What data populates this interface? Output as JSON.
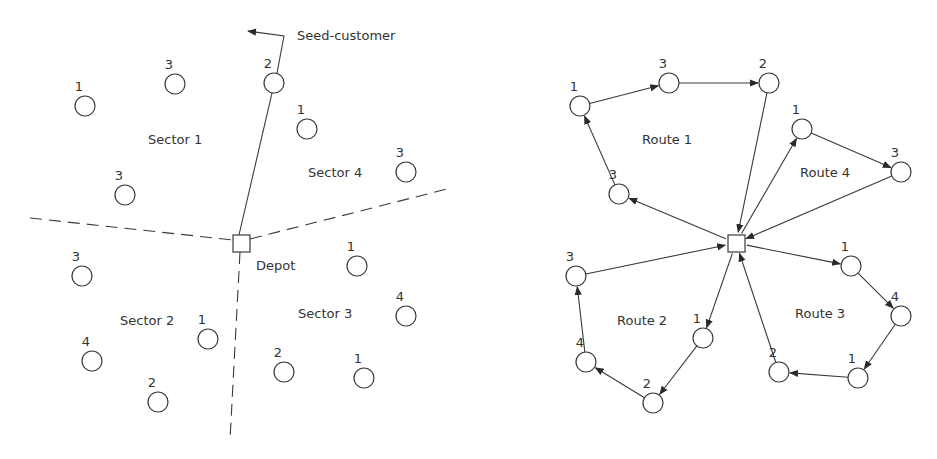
{
  "left_diagram": {
    "depot": {
      "label": "Depot",
      "x": 241,
      "y": 243
    },
    "seed_customer_label": "Seed-customer",
    "sectors": [
      {
        "label": "Sector 1",
        "x": 148,
        "y": 144
      },
      {
        "label": "Sector 2",
        "x": 120,
        "y": 325
      },
      {
        "label": "Sector 3",
        "x": 298,
        "y": 318
      },
      {
        "label": "Sector 4",
        "x": 308,
        "y": 177
      }
    ],
    "customers": [
      {
        "demand": "1",
        "x": 85,
        "y": 106,
        "sector": 1
      },
      {
        "demand": "3",
        "x": 175,
        "y": 84,
        "sector": 1
      },
      {
        "demand": "3",
        "x": 125,
        "y": 195,
        "sector": 1
      },
      {
        "demand": "2",
        "x": 274,
        "y": 83,
        "sector": 1,
        "seed": true
      },
      {
        "demand": "1",
        "x": 307,
        "y": 129,
        "sector": 4
      },
      {
        "demand": "3",
        "x": 406,
        "y": 172,
        "sector": 4
      },
      {
        "demand": "3",
        "x": 82,
        "y": 276,
        "sector": 2
      },
      {
        "demand": "4",
        "x": 92,
        "y": 361,
        "sector": 2
      },
      {
        "demand": "2",
        "x": 158,
        "y": 402,
        "sector": 2
      },
      {
        "demand": "1",
        "x": 208,
        "y": 339,
        "sector": 2
      },
      {
        "demand": "1",
        "x": 357,
        "y": 266,
        "sector": 3
      },
      {
        "demand": "4",
        "x": 406,
        "y": 316,
        "sector": 3
      },
      {
        "demand": "2",
        "x": 284,
        "y": 372,
        "sector": 3
      },
      {
        "demand": "1",
        "x": 364,
        "y": 378,
        "sector": 3
      }
    ]
  },
  "right_diagram": {
    "depot": {
      "x": 736,
      "y": 243
    },
    "routes": [
      {
        "label": "Route 1",
        "lx": 642,
        "ly": 144,
        "stops": [
          {
            "demand": "3",
            "x": 619,
            "y": 194
          },
          {
            "demand": "1",
            "x": 580,
            "y": 106
          },
          {
            "demand": "3",
            "x": 669,
            "y": 83
          },
          {
            "demand": "2",
            "x": 769,
            "y": 83
          }
        ]
      },
      {
        "label": "Route 2",
        "lx": 617,
        "ly": 325,
        "stops": [
          {
            "demand": "1",
            "x": 703,
            "y": 338
          },
          {
            "demand": "2",
            "x": 653,
            "y": 403
          },
          {
            "demand": "4",
            "x": 586,
            "y": 362
          },
          {
            "demand": "3",
            "x": 576,
            "y": 276
          }
        ]
      },
      {
        "label": "Route 3",
        "lx": 795,
        "ly": 318,
        "stops": [
          {
            "demand": "1",
            "x": 851,
            "y": 266
          },
          {
            "demand": "4",
            "x": 901,
            "y": 316
          },
          {
            "demand": "1",
            "x": 858,
            "y": 378
          },
          {
            "demand": "2",
            "x": 779,
            "y": 372
          }
        ]
      },
      {
        "label": "Route 4",
        "lx": 800,
        "ly": 177,
        "stops": [
          {
            "demand": "1",
            "x": 802,
            "y": 129
          },
          {
            "demand": "3",
            "x": 901,
            "y": 172
          }
        ]
      }
    ]
  }
}
